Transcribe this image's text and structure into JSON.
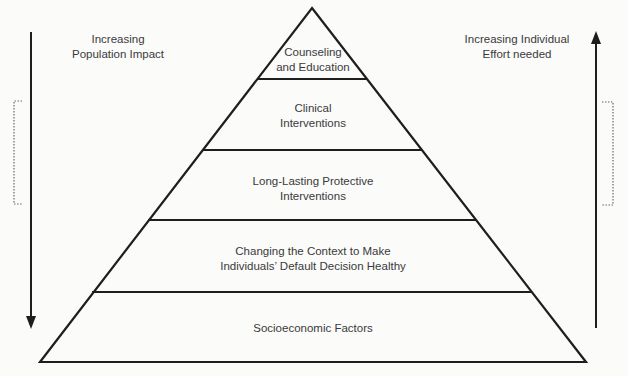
{
  "diagram": {
    "type": "pyramid",
    "tiers": [
      {
        "label_line1": "Counseling",
        "label_line2": "and Education"
      },
      {
        "label_line1": "Clinical",
        "label_line2": "Interventions"
      },
      {
        "label_line1": "Long-Lasting Protective",
        "label_line2": "Interventions"
      },
      {
        "label_line1": "Changing the Context to Make",
        "label_line2": "Individuals’ Default Decision Healthy"
      },
      {
        "label_line1": "Socioeconomic Factors",
        "label_line2": ""
      }
    ],
    "left_axis": {
      "label_line1": "Increasing",
      "label_line2": "Population Impact",
      "direction": "down"
    },
    "right_axis": {
      "label_line1": "Increasing Individual",
      "label_line2": "Effort needed",
      "direction": "up"
    },
    "colors": {
      "line": "#1e1e1e",
      "text": "#3a3a3a",
      "bracket": "#6a6a6a",
      "background": "#fbfbfa"
    }
  }
}
